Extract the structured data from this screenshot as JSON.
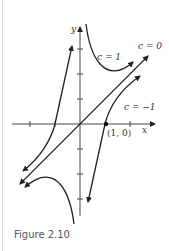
{
  "figure": {
    "caption": "Figure 2.10",
    "axes": {
      "x_label": "x",
      "y_label": "y"
    },
    "point_label": "(1, 0)",
    "curves": [
      {
        "label": "c = 1",
        "equation": "y = x + c/x",
        "c": 1
      },
      {
        "label": "c = 0",
        "equation": "y = x",
        "c": 0
      },
      {
        "label": "c = −1",
        "equation": "y = x + c/x",
        "c": -1
      }
    ],
    "colors": {
      "curve": "#222222",
      "axis": "#444444",
      "caption": "#555555"
    }
  }
}
